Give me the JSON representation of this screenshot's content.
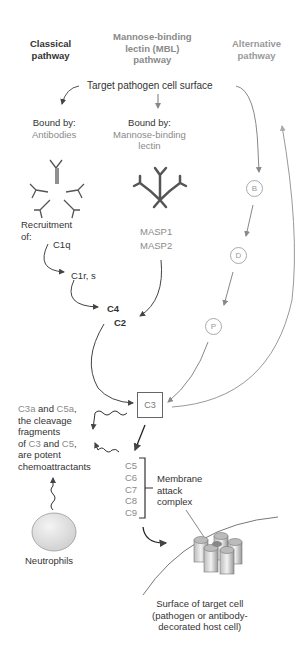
{
  "headers": {
    "classical": [
      "Classical",
      "pathway"
    ],
    "mbl": [
      "Mannose-binding",
      "lectin (MBL)",
      "pathway"
    ],
    "alternative": [
      "Alternative",
      "pathway"
    ]
  },
  "target": "Target pathogen cell surface",
  "classical": {
    "bound_by": "Bound by:",
    "binder": "Antibodies",
    "recruitment": [
      "Recruitment",
      "of:"
    ],
    "steps": [
      "C1q",
      "C1r, s",
      "C4",
      "C2"
    ]
  },
  "mbl": {
    "bound_by": "Bound by:",
    "binder": [
      "Mannose-binding",
      "lectin"
    ],
    "masp": [
      "MASP1",
      "MASP2"
    ]
  },
  "alternative": {
    "factors": [
      "B",
      "D",
      "P"
    ]
  },
  "c3": "C3",
  "chemo": {
    "l1a": "C3a",
    "l1b": " and ",
    "l1c": "C5a",
    "l1d": ",",
    "l2": "the cleavage",
    "l3": "fragments",
    "l4a": "of ",
    "l4b": "C3",
    "l4c": " and ",
    "l4d": "C5",
    "l4e": ",",
    "l5": "are potent",
    "l6": "chemoattractants"
  },
  "mac": {
    "components": [
      "C5",
      "C6",
      "C7",
      "C8",
      "C9"
    ],
    "label": [
      "Membrane",
      "attack",
      "complex"
    ]
  },
  "neutrophils": "Neutrophils",
  "surface": [
    "Surface of target cell",
    "(pathogen or antibody-",
    "decorated host cell)"
  ],
  "colors": {
    "dark": "#333333",
    "gray": "#8a8a8a",
    "light": "#aaaaaa"
  }
}
